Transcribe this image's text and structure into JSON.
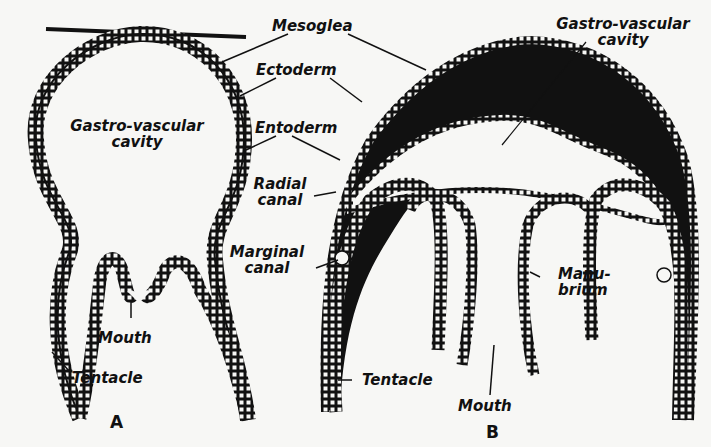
{
  "figure_a": {
    "letter": "A",
    "labels": {
      "cavity_l1": "Gastro-vascular",
      "cavity_l2": "cavity",
      "mouth": "Mouth",
      "tentacle": "Tentacle"
    }
  },
  "figure_b": {
    "letter": "B",
    "labels": {
      "cavity_l1": "Gastro-vascular",
      "cavity_l2": "cavity",
      "manubrium_l1": "Manu-",
      "manubrium_l2": "brium",
      "tentacle": "Tentacle",
      "mouth": "Mouth"
    }
  },
  "shared_labels": {
    "mesoglea": "Mesoglea",
    "ectoderm": "Ectoderm",
    "entoderm": "Entoderm",
    "radial_l1": "Radial",
    "radial_l2": "canal",
    "marginal_l1": "Marginal",
    "marginal_l2": "canal"
  },
  "colors": {
    "ink": "#111111",
    "paper": "#f7f7f5"
  }
}
